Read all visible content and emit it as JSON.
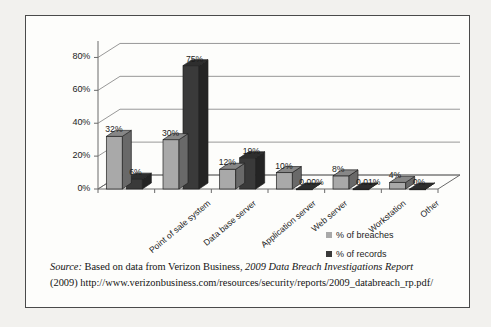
{
  "chart_data": {
    "type": "bar",
    "title": "",
    "subtitle": "",
    "xlabel": "",
    "ylabel": "",
    "ylim": [
      0,
      90
    ],
    "yticks": [
      "0%",
      "20%",
      "40%",
      "60%",
      "80%"
    ],
    "ytick_values": [
      0,
      20,
      40,
      60,
      80
    ],
    "grid": true,
    "legend_position": "bottom-right",
    "style": "3d-clustered-column",
    "categories": [
      "Point of sale system",
      "Data base server",
      "Application server",
      "Web server",
      "Workstation",
      "Other"
    ],
    "series": [
      {
        "name": "% of breaches",
        "color": "#a9a9a9",
        "values": [
          32,
          30,
          12,
          10,
          8,
          4
        ],
        "labels": [
          "32%",
          "30%",
          "12%",
          "10%",
          "8%",
          "4%"
        ]
      },
      {
        "name": "% of records",
        "color": "#3a3a3a",
        "values": [
          6,
          75,
          19,
          0.0,
          0.01,
          0
        ],
        "labels": [
          "6%",
          "75%",
          "19%",
          "0.00%",
          "0.01%",
          "0%"
        ]
      }
    ]
  },
  "legend": {
    "items": [
      {
        "label": "% of breaches",
        "color": "#a9a9a9"
      },
      {
        "label": "% of records",
        "color": "#3a3a3a"
      }
    ]
  },
  "source": {
    "label": "Source:",
    "text_before": "Based on data from Verizon Business,",
    "report_title": "2009 Data Breach Investigations Report",
    "year": "(2009)",
    "url": "http://www.verizonbusiness.com/resources/security/reports/2009_databreach_rp.pdf/"
  },
  "colors": {
    "series_light": "#a9a9a9",
    "series_dark": "#3a3a3a",
    "border": "#4a4a4a",
    "page_background": "#f2f1ee",
    "figure_background": "#fdfdfb",
    "text": "#1c1c1c"
  }
}
